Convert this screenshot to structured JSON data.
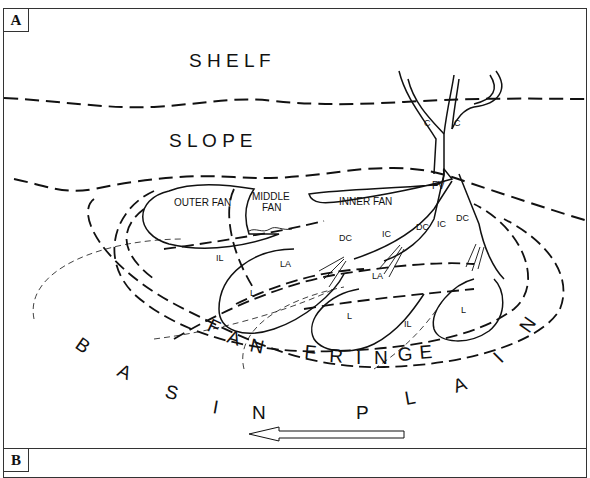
{
  "panels": [
    {
      "id": "A",
      "label": "A"
    },
    {
      "id": "B",
      "label": "B"
    }
  ],
  "diagram": {
    "zones": {
      "shelf": "S H E L F",
      "slope": "S L O P E",
      "fan_fringe": [
        "F",
        "A",
        "N",
        "F",
        "R",
        "I",
        "N",
        "G",
        "E"
      ],
      "basin_plain": [
        "B",
        "A",
        "S",
        "I",
        "N",
        "P",
        "L",
        "A",
        "I",
        "N"
      ]
    },
    "fan_labels": {
      "outer_fan": "OUTER FAN",
      "middle_fan_1": "MIDDLE",
      "middle_fan_2": "FAN",
      "inner_fan": "INNER FAN"
    },
    "abbreviations": {
      "canyon_1": "C",
      "canyon_2": "C",
      "fan_valley": "FV",
      "dc_1": "DC",
      "dc_2": "DC",
      "dc_3": "DC",
      "ic_1": "IC",
      "ic_2": "IC",
      "la_1": "LA",
      "la_2": "LA",
      "il_1": "IL",
      "il_2": "IL",
      "l_1": "L",
      "l_2": "L",
      "l_3": "L"
    },
    "arrow": "current-direction-arrow"
  }
}
